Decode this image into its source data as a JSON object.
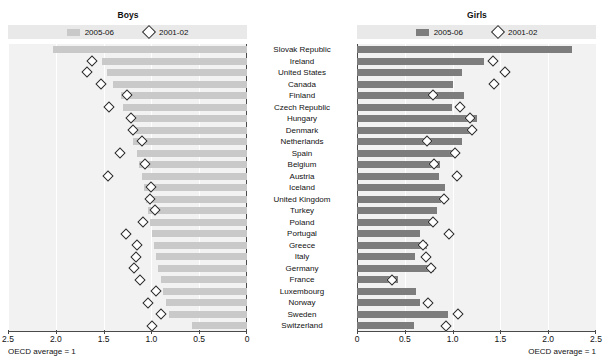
{
  "figure": {
    "clipped_top_title": "",
    "footnote_left": "OECD average = 1",
    "footnote_right": "OECD average = 1"
  },
  "panels": {
    "boys": {
      "title": "Boys",
      "legend": [
        {
          "label": "2005-06",
          "marker": "bar-swatch",
          "color": "#c9c9c9"
        },
        {
          "label": "2001-02",
          "marker": "diamond-outline",
          "color": "#ffffff"
        }
      ],
      "axis": {
        "direction": "right-to-left",
        "ticks": [
          "2.5",
          "2.0",
          "1.5",
          "1.0",
          "0.5",
          "0"
        ],
        "min": 0,
        "max": 2.5
      }
    },
    "girls": {
      "title": "Girls",
      "legend": [
        {
          "label": "2005-06",
          "marker": "bar-swatch",
          "color": "#7d7d7d"
        },
        {
          "label": "2001-02",
          "marker": "diamond-outline",
          "color": "#ffffff"
        }
      ],
      "axis": {
        "direction": "left-to-right",
        "ticks": [
          "0",
          "0.5",
          "1.0",
          "1.5",
          "2.0",
          "2.5"
        ],
        "min": 0,
        "max": 2.5
      }
    }
  },
  "chart_data": {
    "type": "bar",
    "title": "",
    "xlabel": "",
    "ylabel": "",
    "xlim": [
      0,
      2.5
    ],
    "grid": true,
    "legend_position": "top",
    "note": "Paired mirrored horizontal bar charts with overlaid diamond markers; OECD average = 1",
    "categories": [
      "Slovak Republic",
      "Ireland",
      "United States",
      "Canada",
      "Finland",
      "Czech Republic",
      "Hungary",
      "Denmark",
      "Netherlands",
      "Spain",
      "Belgium",
      "Austria",
      "Iceland",
      "United Kingdom",
      "Turkey",
      "Poland",
      "Portugal",
      "Greece",
      "Italy",
      "Germany",
      "France",
      "Luxembourg",
      "Norway",
      "Sweden",
      "Switzerland"
    ],
    "series": [
      {
        "name": "Boys 2005-06",
        "panel": "boys",
        "type": "bar",
        "color": "#c9c9c9",
        "values": [
          2.03,
          1.52,
          1.46,
          1.4,
          1.32,
          1.3,
          1.24,
          1.22,
          1.19,
          1.15,
          1.13,
          1.1,
          1.08,
          1.06,
          1.04,
          1.01,
          0.99,
          0.97,
          0.95,
          0.93,
          0.9,
          0.88,
          0.85,
          0.82,
          0.58
        ]
      },
      {
        "name": "Boys 2001-02",
        "panel": "boys",
        "type": "diamond",
        "color": "#ffffff",
        "values": [
          null,
          1.62,
          1.67,
          1.53,
          1.26,
          1.44,
          1.21,
          1.19,
          1.1,
          1.33,
          1.07,
          1.45,
          1.0,
          1.01,
          0.96,
          1.09,
          1.27,
          1.15,
          1.16,
          1.18,
          1.12,
          0.95,
          1.04,
          0.9,
          0.99
        ]
      },
      {
        "name": "Girls 2005-06",
        "panel": "girls",
        "type": "bar",
        "color": "#7d7d7d",
        "values": [
          2.25,
          1.33,
          1.1,
          1.0,
          1.12,
          0.99,
          1.25,
          1.18,
          1.1,
          1.0,
          0.87,
          0.86,
          0.92,
          0.88,
          0.84,
          0.8,
          0.66,
          0.73,
          0.61,
          0.81,
          0.43,
          0.62,
          0.66,
          0.95,
          0.6
        ]
      },
      {
        "name": "Girls 2001-02",
        "panel": "girls",
        "type": "diamond",
        "color": "#ffffff",
        "values": [
          null,
          1.42,
          1.55,
          1.43,
          0.8,
          1.08,
          1.18,
          1.2,
          0.73,
          1.02,
          0.81,
          1.05,
          null,
          0.91,
          null,
          0.8,
          0.96,
          0.69,
          0.72,
          0.77,
          0.37,
          null,
          0.74,
          1.06,
          0.93
        ]
      }
    ]
  }
}
